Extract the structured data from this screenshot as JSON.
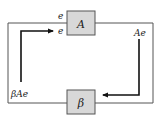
{
  "diagram": {
    "type": "feedback-loop",
    "blocks": [
      {
        "id": "amplifier",
        "label": "A"
      },
      {
        "id": "feedback",
        "label": "β"
      }
    ],
    "labels": {
      "input_top": "e",
      "input_arrow": "e",
      "output": "Ae",
      "feedback_signal": "βAe"
    },
    "colors": {
      "block_fill": "#d8d8d8",
      "stroke": "#555555",
      "arrow": "#111111"
    }
  }
}
